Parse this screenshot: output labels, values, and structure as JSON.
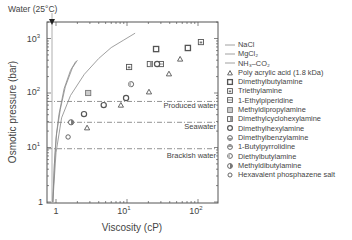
{
  "chart_data": {
    "type": "scatter",
    "title": "",
    "xlabel": "Viscosity (cP)",
    "ylabel": "Osmotic pressure (bar)",
    "xscale": "log",
    "yscale": "log",
    "xlim": [
      0.87,
      220
    ],
    "ylim": [
      1,
      2000
    ],
    "x_ticks": [
      "1",
      "10^1",
      "10^2"
    ],
    "y_ticks": [
      "1",
      "10^1",
      "10^2",
      "10^3"
    ],
    "grid": false,
    "legend_position": "right-outside",
    "annotations": {
      "water": {
        "label": "Water (25°C)",
        "x": 0.89
      },
      "reference_lines": [
        {
          "label": "Produced water",
          "y": 70
        },
        {
          "label": "Seawater",
          "y": 29
        },
        {
          "label": "Brackish water",
          "y": 9.5
        }
      ]
    },
    "curves": [
      {
        "name": "NaCl",
        "points": [
          [
            0.9,
            1
          ],
          [
            0.95,
            5
          ],
          [
            1.0,
            15
          ],
          [
            1.1,
            40
          ],
          [
            1.3,
            120
          ],
          [
            1.6,
            260
          ],
          [
            1.9,
            380
          ]
        ]
      },
      {
        "name": "MgCl2",
        "points": [
          [
            0.9,
            1
          ],
          [
            0.95,
            5
          ],
          [
            1.02,
            18
          ],
          [
            1.15,
            50
          ],
          [
            1.35,
            130
          ],
          [
            1.7,
            290
          ],
          [
            2.0,
            400
          ]
        ]
      },
      {
        "name": "NH3-CO2",
        "points": [
          [
            0.9,
            1
          ],
          [
            1.0,
            8
          ],
          [
            1.2,
            35
          ],
          [
            1.6,
            90
          ],
          [
            2.5,
            220
          ],
          [
            4,
            430
          ],
          [
            6,
            680
          ],
          [
            9,
            940
          ],
          [
            13,
            1250
          ]
        ]
      }
    ],
    "series": [
      {
        "name": "Poly acrylic acid (1.8 kDa)",
        "marker": "triangle",
        "points": [
          [
            2.74,
            23
          ],
          [
            8.2,
            60
          ],
          [
            20.4,
            105
          ],
          [
            39,
            225
          ],
          [
            56,
            420
          ]
        ]
      },
      {
        "name": "Dimethylbutylamine",
        "marker": "square",
        "points": [
          [
            25.7,
            640
          ],
          [
            72,
            670
          ]
        ]
      },
      {
        "name": "Triethylamine",
        "marker": "square-dot",
        "points": [
          [
            10.7,
            300
          ],
          [
            110,
            860
          ]
        ]
      },
      {
        "name": "1-Ethylpiperidine",
        "marker": "square-half",
        "points": [
          [
            30,
            340
          ]
        ]
      },
      {
        "name": "Methyldipropylamine",
        "marker": "square-light",
        "points": [
          [
            2.84,
            100
          ]
        ]
      },
      {
        "name": "Dimethylcyclohexylamine",
        "marker": "square-split",
        "points": [
          [
            21,
            340
          ]
        ]
      },
      {
        "name": "Dimethylhexylamine",
        "marker": "circle",
        "points": [
          [
            2.48,
            41
          ],
          [
            4.7,
            60
          ],
          [
            9.7,
            81
          ],
          [
            26.5,
            340
          ]
        ]
      },
      {
        "name": "Dimethylbenzylamine",
        "marker": "circle-half-bottom",
        "points": []
      },
      {
        "name": "1-Butylpyrrolidine",
        "marker": "circle-half-top",
        "points": []
      },
      {
        "name": "Diethylbutylamine",
        "marker": "circle-half-left",
        "points": [
          [
            11.4,
            145
          ]
        ]
      },
      {
        "name": "Methyldibutylamine",
        "marker": "circle-half-right",
        "points": [
          [
            1.63,
            29
          ]
        ]
      },
      {
        "name": "Hexavalent phosphazene salt",
        "marker": "circle-small",
        "points": [
          [
            1.48,
            15.6
          ]
        ]
      }
    ]
  },
  "legend": {
    "items": [
      {
        "label": "NaCl",
        "sym": "line"
      },
      {
        "label": "MgCl₂",
        "sym": "line"
      },
      {
        "label": "NH₃–CO₂",
        "sym": "line"
      },
      {
        "label": "Poly acrylic acid (1.8 kDa)",
        "sym": "triangle"
      },
      {
        "label": "Dimethylbutylamine",
        "sym": "square"
      },
      {
        "label": "Triethylamine",
        "sym": "square-dot"
      },
      {
        "label": "1-Ethylpiperidine",
        "sym": "square-half"
      },
      {
        "label": "Methyldipropylamine",
        "sym": "square-light"
      },
      {
        "label": "Dimethylcyclohexylamine",
        "sym": "square-split"
      },
      {
        "label": "Dimethylhexylamine",
        "sym": "circle"
      },
      {
        "label": "Dimethylbenzylamine",
        "sym": "circle-half-bottom"
      },
      {
        "label": "1-Butylpyrrolidine",
        "sym": "circle-half-top"
      },
      {
        "label": "Diethylbutylamine",
        "sym": "circle-half-left"
      },
      {
        "label": "Methyldibutylamine",
        "sym": "circle-half-right"
      },
      {
        "label": "Hexavalent phosphazene salt",
        "sym": "circle-small"
      }
    ]
  },
  "labels": {
    "water": "Water (25°C)",
    "produced": "Produced water",
    "seawater": "Seawater",
    "brackish": "Brackish water",
    "xlabel": "Viscosity (cP)",
    "ylabel": "Osmotic pressure (bar)",
    "x1": "1",
    "x10": "10",
    "x100": "10",
    "y1": "1",
    "y10": "10",
    "y100": "10",
    "y1000": "10"
  }
}
